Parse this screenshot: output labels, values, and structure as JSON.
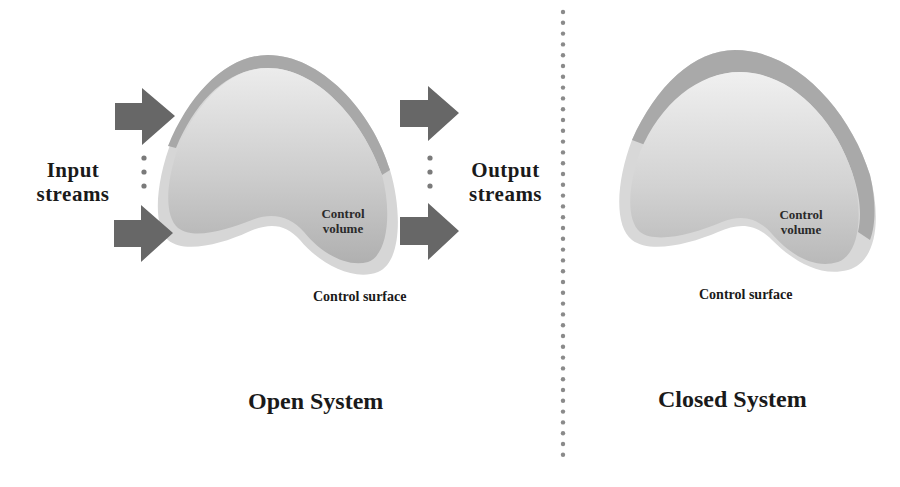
{
  "divider": {
    "style": "dotted",
    "color": "#8a8a8a"
  },
  "open_system": {
    "title": "Open System",
    "input_label": [
      "Input",
      "streams"
    ],
    "output_label": [
      "Output",
      "streams"
    ],
    "control_volume_label": [
      "Control",
      "volume"
    ],
    "control_surface_label": "Control surface",
    "arrows": {
      "input_count_shown": 2,
      "output_count_shown": 2,
      "ellipsis": "⋮"
    }
  },
  "closed_system": {
    "title": "Closed System",
    "control_volume_label": [
      "Control",
      "volume"
    ],
    "control_surface_label": "Control surface"
  },
  "colors": {
    "arrow": "#666666",
    "surface_outer": "#d4d4d4",
    "surface_top_band": "#a9a9a9",
    "volume_light": "#e9e9e9",
    "volume_dark": "#b3b3b3",
    "text": "#1a1a1a"
  }
}
